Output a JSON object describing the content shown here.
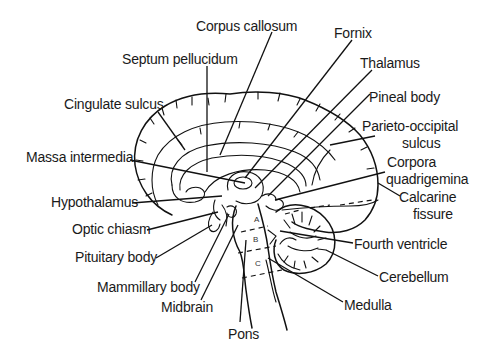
{
  "diagram": {
    "labels": {
      "corpus_callosum": "Corpus callosum",
      "septum_pellucidum": "Septum pellucidum",
      "fornix": "Fornix",
      "thalamus": "Thalamus",
      "pineal_body": "Pineal body",
      "parieto_occipital_line1": "Parieto-occipital",
      "parieto_occipital_line2": "sulcus",
      "cingulate_sulcus": "Cingulate sulcus",
      "massa_intermedia": "Massa intermedia",
      "corpora_line1": "Corpora",
      "corpora_line2": "quadrigemina",
      "calcarine_line1": "Calcarine",
      "calcarine_line2": "fissure",
      "hypothalamus": "Hypothalamus",
      "optic_chiasm": "Optic chiasm",
      "pituitary_body": "Pituitary body",
      "mammillary_body": "Mammillary body",
      "midbrain": "Midbrain",
      "pons": "Pons",
      "fourth_ventricle": "Fourth ventricle",
      "cerebellum": "Cerebellum",
      "medulla": "Medulla"
    },
    "brainstem_markers": {
      "a": "A",
      "b": "B",
      "c": "C"
    },
    "colors": {
      "ink": "#111111",
      "background": "#ffffff"
    }
  }
}
